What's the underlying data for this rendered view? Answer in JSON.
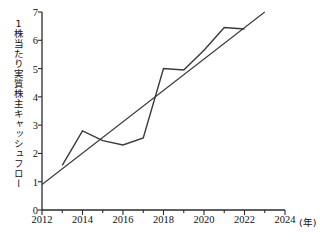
{
  "chart_data": {
    "type": "line",
    "title": "",
    "xlabel": "年",
    "ylabel": "1株当たり実質株主キャッシュフロー",
    "xlim": [
      2012,
      2024
    ],
    "ylim": [
      0,
      7
    ],
    "grid": false,
    "legend": "none",
    "x_tick_labels": [
      "2012",
      "2014",
      "2016",
      "2018",
      "2020",
      "2022",
      "2024"
    ],
    "x_tick_values": [
      2012,
      2014,
      2016,
      2018,
      2020,
      2022,
      2024
    ],
    "x_minor_ticks": [
      2013,
      2015,
      2017,
      2019,
      2021,
      2023
    ],
    "y_tick_labels": [
      "0",
      "1",
      "2",
      "3",
      "4",
      "5",
      "6",
      "7"
    ],
    "y_tick_values": [
      0,
      1,
      2,
      3,
      4,
      5,
      6,
      7
    ],
    "x_unit_suffix": "(年)",
    "series": [
      {
        "name": "1株当たり実質株主キャッシュフロー",
        "kind": "data-line",
        "color": "#3a3a3a",
        "x": [
          2013,
          2014,
          2015,
          2016,
          2017,
          2018,
          2019,
          2020,
          2021,
          2022
        ],
        "values": [
          1.58,
          2.8,
          2.45,
          2.3,
          2.55,
          5.0,
          4.95,
          5.65,
          6.45,
          6.4
        ]
      },
      {
        "name": "近似直線",
        "kind": "trend-line",
        "color": "#3a3a3a",
        "x": [
          2012,
          2023
        ],
        "values": [
          0.9,
          7.0
        ]
      }
    ]
  },
  "axes": {
    "y_axis_name": "y-axis",
    "x_axis_name": "x-axis"
  }
}
